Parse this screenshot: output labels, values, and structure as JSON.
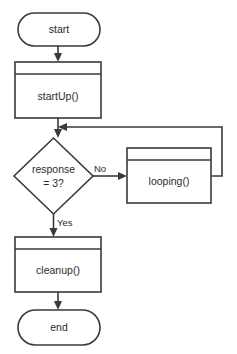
{
  "diagram": {
    "type": "flowchart",
    "title": "",
    "background_color": "#ffffff",
    "stroke_color": "#3a3a3a",
    "text_color": "#2b2b2b",
    "nodes": [
      {
        "id": "start",
        "label": "start",
        "shape": "terminator",
        "x": 18,
        "y": 13,
        "width": 82,
        "height": 33
      },
      {
        "id": "startup",
        "label": "startUp()",
        "shape": "process-with-title-band",
        "x": 15,
        "y": 62,
        "width": 86,
        "height": 56
      },
      {
        "id": "decision",
        "label_line1": "response",
        "label_line2": "= 3?",
        "shape": "decision",
        "x": 14,
        "y": 138,
        "width": 79,
        "height": 76
      },
      {
        "id": "looping",
        "label": "looping()",
        "shape": "process-with-title-band",
        "x": 127,
        "y": 148,
        "width": 84,
        "height": 55
      },
      {
        "id": "cleanup",
        "label": "cleanup()",
        "shape": "process-with-title-band",
        "x": 15,
        "y": 237,
        "width": 86,
        "height": 55
      },
      {
        "id": "end",
        "label": "end",
        "shape": "terminator",
        "x": 18,
        "y": 310,
        "width": 82,
        "height": 35
      }
    ],
    "edges": [
      {
        "id": "start-to-startup",
        "from": "start",
        "to": "startup",
        "label": ""
      },
      {
        "id": "startup-to-decision",
        "from": "startup",
        "to": "decision",
        "label": ""
      },
      {
        "id": "decision-to-looping",
        "from": "decision",
        "to": "looping",
        "label": "No"
      },
      {
        "id": "looping-to-decision-loop",
        "from": "looping",
        "to": "startup-decision-junction",
        "label": ""
      },
      {
        "id": "decision-to-cleanup",
        "from": "decision",
        "to": "cleanup",
        "label": "Yes"
      },
      {
        "id": "cleanup-to-end",
        "from": "cleanup",
        "to": "end",
        "label": ""
      }
    ],
    "edge_labels": {
      "no": "No",
      "yes": "Yes"
    }
  }
}
